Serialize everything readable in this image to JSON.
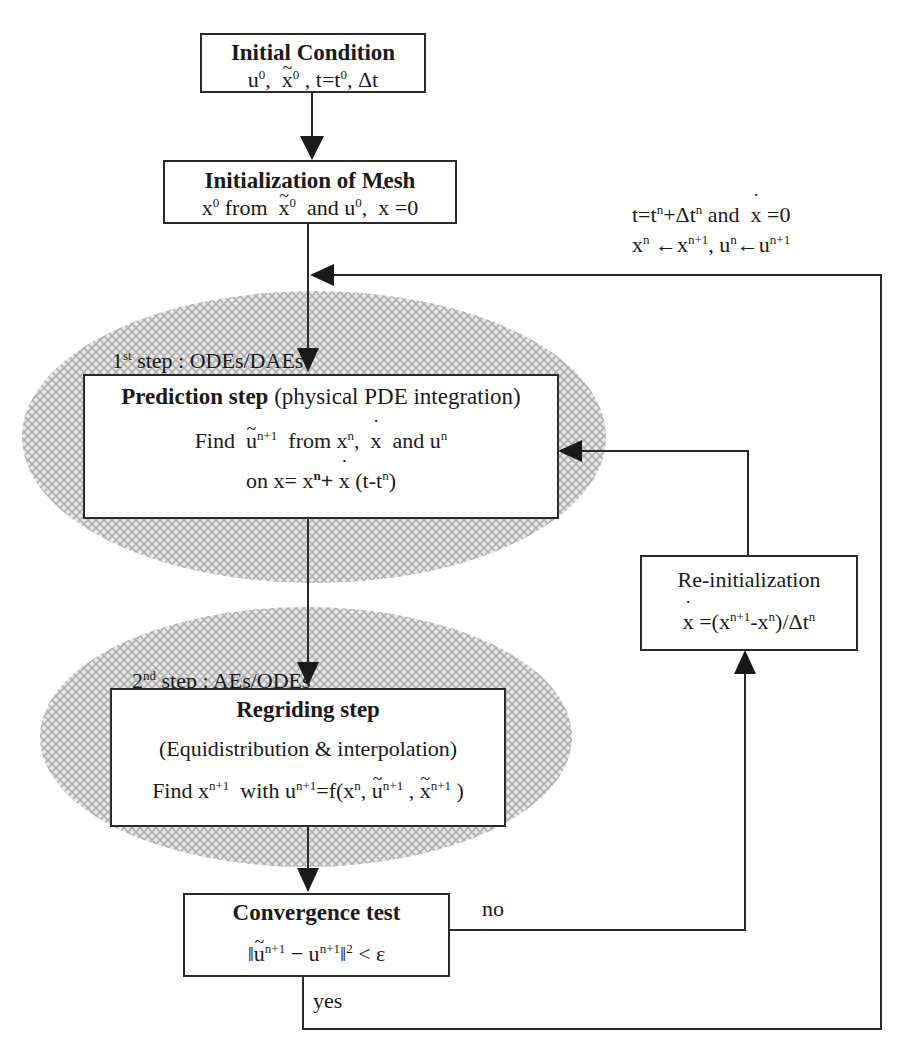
{
  "diagram": {
    "type": "flowchart",
    "nodes": {
      "initial_condition": {
        "title": "Initial Condition",
        "line1": "u⁰, x̃⁰, t=t⁰, Δt"
      },
      "init_mesh": {
        "title": "Initialization of Mesh",
        "line1": "x⁰ from x̃⁰ and u⁰, ẋ=0"
      },
      "prediction": {
        "step_label": "1st step : ODEs/DAEs",
        "title_bold": "Prediction step",
        "title_rest": "(physical PDE integration)",
        "line1": "Find ũⁿ⁺¹ from xⁿ, ẋ and uⁿ",
        "line2": "on x= xⁿ+ ẋ (t-tⁿ)"
      },
      "regriding": {
        "step_label": "2nd step : AEs/ODEs",
        "title": "Regriding step",
        "line1": "(Equidistribution & interpolation)",
        "line2": "Find xⁿ⁺¹ with uⁿ⁺¹=f(xⁿ, ũⁿ⁺¹, x̃ⁿ⁺¹)"
      },
      "convergence": {
        "title": "Convergence test",
        "line1": "‖ũⁿ⁺¹ − uⁿ⁺¹‖² < ε"
      },
      "reinit": {
        "title": "Re-initialization",
        "line1": "ẋ =(xⁿ⁺¹-xⁿ)/Δtⁿ"
      }
    },
    "edge_labels": {
      "no": "no",
      "yes": "yes",
      "loop_line1": "t=tⁿ+Δtⁿ and ẋ =0",
      "loop_line2": "xⁿ ←xⁿ⁺¹, uⁿ←uⁿ⁺¹"
    },
    "text_pieces": {
      "comma": ",",
      "and": "and",
      "from": "from",
      "with": "with",
      "find": "Find",
      "on": "on"
    },
    "colors": {
      "line": "#2a2a2a",
      "hatch_light": "#e6e6e6",
      "hatch_dark": "#b5b5b5",
      "box_fill": "#ffffff"
    }
  }
}
